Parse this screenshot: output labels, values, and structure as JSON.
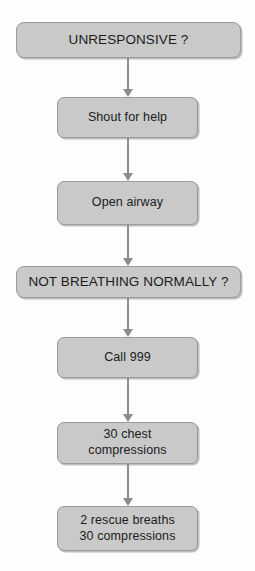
{
  "diagram": {
    "type": "flowchart",
    "orientation": "top-to-bottom",
    "colors": {
      "node_fill": "#c9c9c9",
      "node_border": "#9a9a9a",
      "arrow": "#8c8c8c",
      "text": "#1b1b1b",
      "background": "#fdfdfd"
    },
    "nodes": [
      {
        "id": "unresponsive",
        "label": "UNRESPONSIVE ?",
        "shape": "rounded-rectangle",
        "style": "wide",
        "x": 16,
        "y": 22,
        "w": 225,
        "h": 36
      },
      {
        "id": "shout-for-help",
        "label": "Shout for help",
        "shape": "rounded-rectangle",
        "style": "narrow",
        "x": 57,
        "y": 97,
        "w": 141,
        "h": 41
      },
      {
        "id": "open-airway",
        "label": "Open airway",
        "shape": "rounded-rectangle",
        "style": "narrow",
        "x": 57,
        "y": 181,
        "w": 141,
        "h": 44
      },
      {
        "id": "not-breathing-normally",
        "label": "NOT BREATHING NORMALLY ?",
        "shape": "rounded-rectangle",
        "style": "wide",
        "x": 16,
        "y": 266,
        "w": 225,
        "h": 32
      },
      {
        "id": "call-999",
        "label": "Call 999",
        "shape": "rounded-rectangle",
        "style": "narrow",
        "x": 57,
        "y": 337,
        "w": 141,
        "h": 41
      },
      {
        "id": "chest-compressions",
        "label": "30 chest\ncompressions",
        "shape": "rounded-rectangle",
        "style": "narrow",
        "x": 57,
        "y": 422,
        "w": 141,
        "h": 42
      },
      {
        "id": "rescue-breaths",
        "label": "2 rescue breaths\n30 compressions",
        "shape": "rounded-rectangle",
        "style": "narrow",
        "x": 57,
        "y": 506,
        "w": 141,
        "h": 45
      }
    ],
    "connectors": [
      {
        "id": "c1",
        "from": "unresponsive",
        "to": "shout-for-help",
        "x": 121,
        "y": 58,
        "h": 39
      },
      {
        "id": "c2",
        "from": "shout-for-help",
        "to": "open-airway",
        "x": 121,
        "y": 138,
        "h": 43
      },
      {
        "id": "c3",
        "from": "open-airway",
        "to": "not-breathing-normally",
        "x": 121,
        "y": 225,
        "h": 41
      },
      {
        "id": "c4",
        "from": "not-breathing-normally",
        "to": "call-999",
        "x": 121,
        "y": 298,
        "h": 39
      },
      {
        "id": "c5",
        "from": "call-999",
        "to": "chest-compressions",
        "x": 121,
        "y": 378,
        "h": 44
      },
      {
        "id": "c6",
        "from": "chest-compressions",
        "to": "rescue-breaths",
        "x": 121,
        "y": 464,
        "h": 42
      }
    ]
  }
}
